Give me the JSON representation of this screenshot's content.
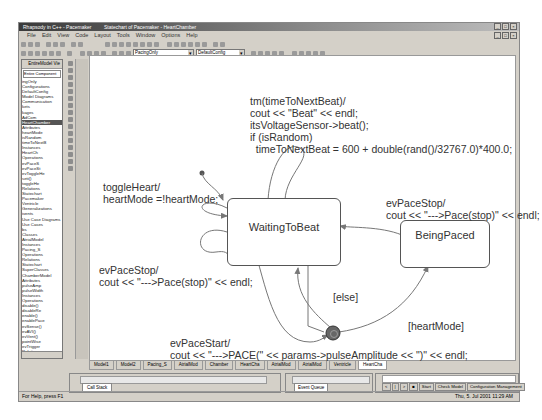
{
  "window": {
    "title": "Rhapsody in C++ - Pacemaker",
    "doc_title": "Statechart of Pacemaker - HeartChamber",
    "controls": [
      "_",
      "□",
      "×"
    ]
  },
  "menu": [
    "File",
    "Edit",
    "View",
    "Code",
    "Layout",
    "Tools",
    "Window",
    "Options",
    "Help"
  ],
  "toolbar": {
    "combo1": "PacingOnly",
    "combo2": "DefaultConfig"
  },
  "browser": {
    "header": "EntireModel Vie",
    "selector": "Entire Component",
    "items": [
      {
        "label": "ingOnly"
      },
      {
        "label": "Configurations"
      },
      {
        "label": "DefaultConfig"
      },
      {
        "label": "Model Diagrams"
      },
      {
        "label": "Communication"
      },
      {
        "label": "kets"
      },
      {
        "label": "kages"
      },
      {
        "label": "AdCom"
      },
      {
        "label": "HeartChamber",
        "highlight": true
      },
      {
        "label": "Attributes"
      },
      {
        "label": "heartMode"
      },
      {
        "label": "isRandom"
      },
      {
        "label": "timeToNextB"
      },
      {
        "label": "Instances"
      },
      {
        "label": "HeartCh"
      },
      {
        "label": "Operations"
      },
      {
        "label": "evPaceS"
      },
      {
        "label": "evPaceSt"
      },
      {
        "label": "evToggleHe"
      },
      {
        "label": "seti()"
      },
      {
        "label": "toggleHe"
      },
      {
        "label": "Relations"
      },
      {
        "label": "Statechart"
      },
      {
        "label": "Pacemaker"
      },
      {
        "label": "Ventricle"
      },
      {
        "label": "Generalizations"
      },
      {
        "label": "ivents"
      },
      {
        "label": "Use Case Diagrams"
      },
      {
        "label": "Use Cases"
      },
      {
        "label": "bs"
      },
      {
        "label": "Classes"
      },
      {
        "label": "AtrialModel"
      },
      {
        "label": "Instances"
      },
      {
        "label": "Pacing_S"
      },
      {
        "label": "Operations"
      },
      {
        "label": "Relations"
      },
      {
        "label": "Statechart"
      },
      {
        "label": "SuperClasses"
      },
      {
        "label": "ChamberModel"
      },
      {
        "label": "Attributes"
      },
      {
        "label": "pulseAmp"
      },
      {
        "label": "pulseWidth"
      },
      {
        "label": "Instances"
      },
      {
        "label": "Operations"
      },
      {
        "label": "disable()"
      },
      {
        "label": "disableRe"
      },
      {
        "label": "enable()"
      },
      {
        "label": "enablePace"
      },
      {
        "label": "evSense()"
      },
      {
        "label": "evAVI()"
      },
      {
        "label": "evVent()"
      },
      {
        "label": "pointWise"
      },
      {
        "label": "evTrigger"
      },
      {
        "label": "Relations"
      },
      {
        "label": "Statechart"
      },
      {
        "label": "ObjectClasses"
      }
    ]
  },
  "diagram": {
    "states": [
      {
        "id": "waiting",
        "name": "WaitingToBeat"
      },
      {
        "id": "paced",
        "name": "BeingPaced"
      }
    ],
    "labels": {
      "timeout": "tm(timeToNextBeat)/\ncout << \"Beat\" << endl;\nitsVoltageSensor->beat();\nif (isRandom)\n  timeToNextBeat = 600 + double(rand()/32767.0)*400.0;",
      "toggle": "toggleHeart/\nheartMode =!heartMode;",
      "pacestop_left": "evPaceStop/\ncout << \"--->Pace(stop)\" << endl;",
      "pacestop_right": "evPaceStop/\ncout << \"--->Pace(stop)\" << endl;",
      "else_guard": "[else]",
      "heartmode_guard": "[heartMode]",
      "pacestart": "evPaceStart/\ncout << \"--->PACE(\" << params->pulseAmplitude << \")\" << endl;"
    }
  },
  "tabs": [
    "Model1",
    "Model2",
    "Pacing_S",
    "AtrialMod",
    "Chamber",
    "HeartCha",
    "AtrialMod",
    "AtrialMod",
    "Ventricle",
    "HeartCha"
  ],
  "output": {
    "tab": "Call Stack"
  },
  "events": {
    "tab": "Event Queue"
  },
  "animation": {
    "buttons": [
      "<",
      "|",
      ">",
      "■",
      "Start",
      "Check Model",
      "Configuration Management"
    ]
  },
  "status": {
    "left": "For Help, press F1",
    "right": "Thu, 5. Jul 2001  11:29 AM"
  }
}
